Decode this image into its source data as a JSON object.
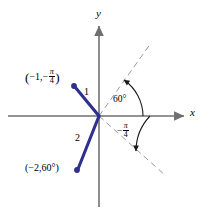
{
  "figure": {
    "type": "polar-coordinate-diagram",
    "background_color": "#ffffff",
    "axis_color": "#6f6f6f",
    "ray_color": "#2f2f8f",
    "dashed_color": "#9a9a9a",
    "arc_color": "#1a1a1a",
    "text_color": "#000000"
  },
  "axes": {
    "x_label": "x",
    "y_label": "y",
    "origin": {
      "x": 99,
      "y": 116
    }
  },
  "points": [
    {
      "name": "point-1",
      "label_r": "−1",
      "label_theta": "−π/4",
      "label_full": "(−1, −π/4)",
      "segment_label": "1",
      "dot": {
        "x": 74,
        "y": 86
      }
    },
    {
      "name": "point-2",
      "label_r": "−2",
      "label_theta": "60°",
      "label_full": "(−2, 60°)",
      "segment_label": "2",
      "dot": {
        "x": 77,
        "y": 170
      }
    }
  ],
  "angles": [
    {
      "name": "angle-60",
      "label": "60°",
      "degrees": 60,
      "direction": "counterclockwise-from-positive-x-axis"
    },
    {
      "name": "angle-neg-pi-over-4",
      "label_numerator": "π",
      "label_denominator": "4",
      "label_sign": "−",
      "label": "−π/4",
      "degrees": -45,
      "direction": "clockwise-from-positive-x-axis"
    }
  ],
  "labels": {
    "point1_open_paren": "(",
    "point1_r": "−1,",
    "point1_minus": "−",
    "point1_pi": "π",
    "point1_four": "4",
    "point1_close_paren": ")",
    "point2_text": "(−2,60°)",
    "segment1": "1",
    "segment2": "2",
    "angle60": "60°",
    "angle_neg_minus": "−",
    "angle_neg_pi": "π",
    "angle_neg_four": "4",
    "x_axis": "x",
    "y_axis": "y"
  }
}
